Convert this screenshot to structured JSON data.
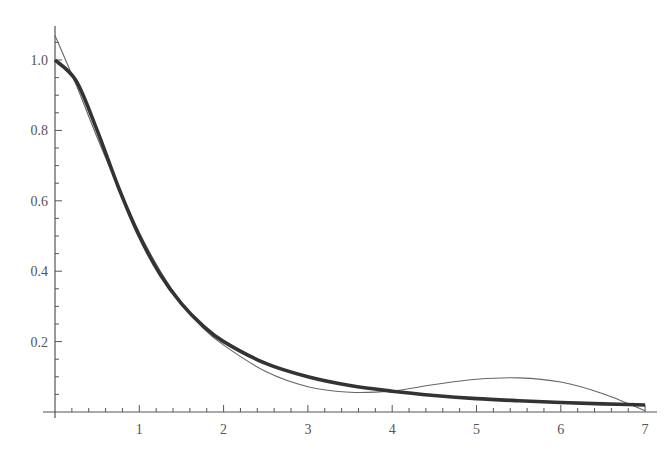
{
  "chart_data": {
    "type": "line",
    "title": "",
    "xlabel": "",
    "ylabel": "",
    "xlim": [
      0,
      7.15
    ],
    "ylim": [
      0,
      1.09
    ],
    "grid": false,
    "legend": null,
    "x_ticks": [
      1,
      2,
      3,
      4,
      5,
      6,
      7
    ],
    "y_ticks": [
      0.2,
      0.4,
      0.6,
      0.8,
      1.0
    ],
    "x_tick_labels": [
      "1",
      "2",
      "3",
      "4",
      "5",
      "6",
      "7"
    ],
    "y_tick_labels": [
      "0.2",
      "0.4",
      "0.6",
      "0.8",
      "1.0"
    ],
    "series": [
      {
        "name": "exact function (thick)",
        "style": "thick",
        "color": "#333333",
        "x": [
          0,
          0.25,
          0.5,
          0.75,
          1,
          1.25,
          1.5,
          1.75,
          2,
          2.5,
          3,
          3.5,
          4,
          4.5,
          5,
          5.5,
          6,
          6.5,
          7
        ],
        "y": [
          1.0,
          0.941,
          0.8,
          0.64,
          0.5,
          0.39,
          0.308,
          0.246,
          0.2,
          0.138,
          0.1,
          0.075,
          0.059,
          0.047,
          0.038,
          0.032,
          0.027,
          0.023,
          0.02
        ]
      },
      {
        "name": "polynomial approximation (thin)",
        "style": "thin",
        "color": "#666666",
        "x": [
          0,
          0.25,
          0.5,
          0.75,
          1,
          1.25,
          1.5,
          1.75,
          2,
          2.5,
          3,
          3.5,
          4,
          4.5,
          5,
          5.5,
          6,
          6.5,
          7
        ],
        "y": [
          1.07,
          0.93,
          0.78,
          0.64,
          0.51,
          0.4,
          0.31,
          0.24,
          0.19,
          0.115,
          0.072,
          0.056,
          0.06,
          0.078,
          0.093,
          0.097,
          0.085,
          0.052,
          0.004
        ]
      }
    ]
  }
}
